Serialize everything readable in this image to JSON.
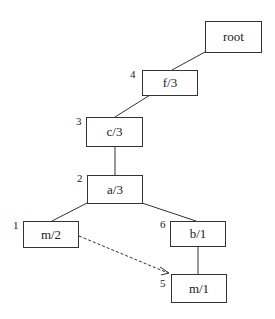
{
  "diagram": {
    "nodes": [
      {
        "id": "root",
        "label": "root",
        "order": ""
      },
      {
        "id": "f",
        "label": "f/3",
        "order": "4"
      },
      {
        "id": "c",
        "label": "c/3",
        "order": "3"
      },
      {
        "id": "a",
        "label": "a/3",
        "order": "2"
      },
      {
        "id": "m2",
        "label": "m/2",
        "order": "1"
      },
      {
        "id": "b",
        "label": "b/1",
        "order": "6"
      },
      {
        "id": "m1",
        "label": "m/1",
        "order": "5"
      }
    ],
    "edges": [
      {
        "from": "root",
        "to": "f",
        "style": "solid"
      },
      {
        "from": "f",
        "to": "c",
        "style": "solid"
      },
      {
        "from": "c",
        "to": "a",
        "style": "solid"
      },
      {
        "from": "a",
        "to": "m2",
        "style": "solid"
      },
      {
        "from": "a",
        "to": "b",
        "style": "solid"
      },
      {
        "from": "b",
        "to": "m1",
        "style": "solid"
      },
      {
        "from": "m2",
        "to": "m1",
        "style": "dashed-arrow"
      }
    ]
  }
}
